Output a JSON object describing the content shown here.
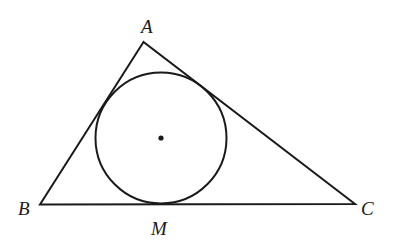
{
  "diagram": {
    "type": "triangle-with-incircle",
    "stroke_color": "#1a1a1a",
    "background": "#ffffff",
    "vertices": {
      "A": {
        "label": "A",
        "x": 143.5,
        "y": 42
      },
      "B": {
        "label": "B",
        "x": 40,
        "y": 204.5
      },
      "C": {
        "label": "C",
        "x": 355,
        "y": 204
      }
    },
    "incircle": {
      "cx": 161,
      "cy": 138,
      "r": 65.5
    },
    "center_point": {
      "cx": 161,
      "cy": 138
    },
    "tangent_point": {
      "label": "M",
      "x": 161,
      "y": 204.3
    },
    "labels": {
      "A": "A",
      "B": "B",
      "C": "C",
      "M": "M"
    }
  }
}
